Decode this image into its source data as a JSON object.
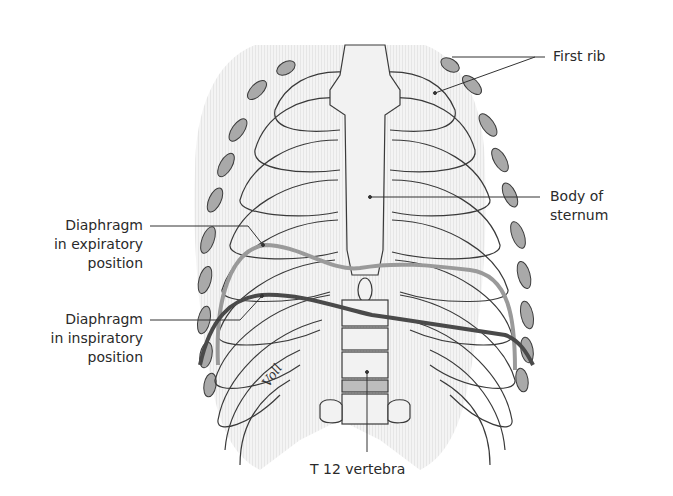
{
  "figure": {
    "signature": "Voll",
    "colors": {
      "bone_fill": "#f2f2f2",
      "bone_outline": "#3a3a3a",
      "cartilage_fill": "#a9a9a9",
      "expiratory_line": "#9a9a9a",
      "inspiratory_line": "#4a4a4a",
      "leader_line": "#333333"
    }
  },
  "labels": {
    "first_rib": {
      "lines": [
        "First rib"
      ]
    },
    "body_of_sternum": {
      "lines": [
        "Body of",
        "sternum"
      ]
    },
    "diaphragm_expiratory": {
      "lines": [
        "Diaphragm",
        "in expiratory",
        "position"
      ]
    },
    "diaphragm_inspiratory": {
      "lines": [
        "Diaphragm",
        "in inspiratory",
        "position"
      ]
    },
    "t12_vertebra": {
      "lines": [
        "T 12 vertebra"
      ]
    }
  }
}
